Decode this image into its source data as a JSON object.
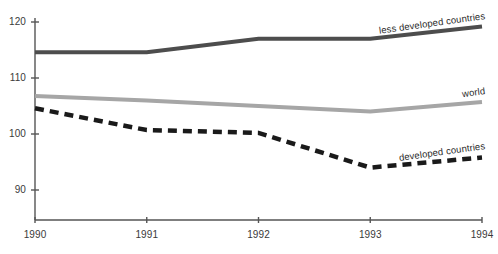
{
  "chart_data": {
    "type": "line",
    "title": "",
    "subtitle": "",
    "xlabel": "",
    "ylabel": "",
    "x": [
      1990,
      1991,
      1992,
      1993,
      1994
    ],
    "xtick_labels": [
      "1990",
      "1991",
      "1992",
      "1993",
      "1994"
    ],
    "ytick_labels": [
      "90",
      "100",
      "110",
      "120"
    ],
    "yticks": [
      90,
      100,
      110,
      120
    ],
    "ylim": [
      85,
      121
    ],
    "xlim": [
      1990,
      1994
    ],
    "grid": false,
    "legend_position": "inline-right-of-series",
    "series": [
      {
        "name": "less developed countries",
        "values": [
          114.6,
          114.6,
          117.0,
          117.0,
          119.2
        ],
        "color": "#4d4d4d",
        "style": "solid",
        "width": 4,
        "label_angle": -8
      },
      {
        "name": "world",
        "values": [
          106.8,
          106.0,
          105.0,
          104.0,
          105.7
        ],
        "color": "#a6a6a6",
        "style": "solid",
        "width": 4,
        "label_angle": -8
      },
      {
        "name": "developed countries",
        "values": [
          104.6,
          100.7,
          100.2,
          94.0,
          95.8
        ],
        "color": "#1a1a1a",
        "style": "dashed",
        "width": 4.5,
        "label_angle": -8
      }
    ]
  },
  "axes": {
    "axis_color": "#555555",
    "tick_color": "#555555",
    "y_tick_labels": [
      {
        "text": "120",
        "value": 120
      },
      {
        "text": "110",
        "value": 110
      },
      {
        "text": "100",
        "value": 100
      },
      {
        "text": "90",
        "value": 90
      }
    ],
    "x_tick_labels": [
      {
        "text": "1990",
        "value": 1990
      },
      {
        "text": "1991",
        "value": 1991
      },
      {
        "text": "1992",
        "value": 1992
      },
      {
        "text": "1993",
        "value": 1993
      },
      {
        "text": "1994",
        "value": 1994
      }
    ]
  },
  "labels": {
    "less_developed": "less developed countries",
    "world": "world",
    "developed": "developed countries"
  }
}
